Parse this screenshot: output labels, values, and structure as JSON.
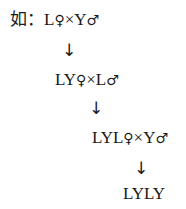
{
  "lines": [
    {
      "prefix": "如：",
      "a": "L",
      "a_sym": "♀",
      "times": "×",
      "b": "Y",
      "b_sym": "♂"
    },
    {
      "prefix": "",
      "a": "LY",
      "a_sym": "♀",
      "times": "×",
      "b": "L",
      "b_sym": "♂"
    },
    {
      "prefix": "",
      "a": "LYL",
      "a_sym": "♀",
      "times": "×",
      "b": "Y",
      "b_sym": "♂"
    }
  ],
  "result": "LYLY",
  "arrow": "↓"
}
